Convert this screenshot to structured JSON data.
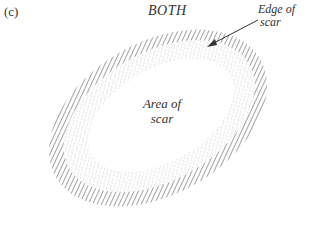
{
  "panel": {
    "label": "(c)"
  },
  "figure": {
    "title": "BOTH",
    "labels": {
      "edge_line1": "Edge of",
      "edge_line2": "scar",
      "area_line1": "Area of",
      "area_line2": "scar"
    },
    "colors": {
      "ink": "#555555",
      "stipple": "#888888",
      "background": "#ffffff"
    }
  }
}
